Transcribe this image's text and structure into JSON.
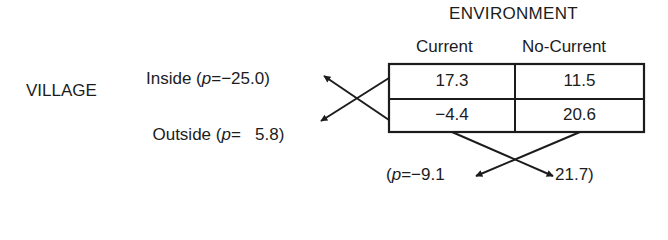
{
  "environment": {
    "title": "ENVIRONMENT",
    "columns": [
      "Current",
      "No-Current"
    ]
  },
  "village": {
    "title": "VILLAGE",
    "rows": [
      {
        "label_prefix": "Inside (",
        "p_symbol": "p",
        "p_value_text": "=−25.0)",
        "p": -25.0
      },
      {
        "label_prefix": "Outside (",
        "p_symbol": "p",
        "p_value_text": "=   5.8)",
        "p": 5.8
      }
    ]
  },
  "table": {
    "cells": [
      [
        "17.3",
        "11.5"
      ],
      [
        "−4.4",
        "20.6"
      ]
    ]
  },
  "column_effects": {
    "open_paren": "(",
    "p_symbol": "p",
    "current_text": "=−9.1",
    "no_current_text": "21.7)",
    "current": -9.1,
    "no_current": 21.7
  },
  "colors": {
    "ink": "#1c1c1c",
    "background": "#ffffff"
  }
}
